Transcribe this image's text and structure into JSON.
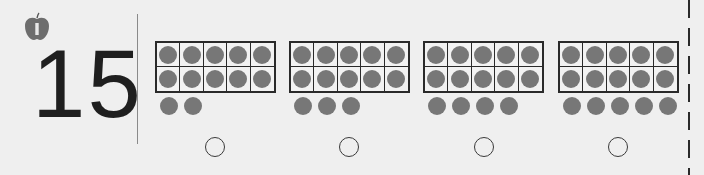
{
  "target_number": "15",
  "icon": "apple-icon",
  "colors": {
    "dot": "#777777",
    "frame_border": "#2a2a2a",
    "background": "#efefef",
    "number": "#1f1f1f"
  },
  "choices": [
    {
      "frame_full_dots": 10,
      "extra_dots": 2,
      "represents": 12
    },
    {
      "frame_full_dots": 10,
      "extra_dots": 3,
      "represents": 13
    },
    {
      "frame_full_dots": 10,
      "extra_dots": 4,
      "represents": 14
    },
    {
      "frame_full_dots": 10,
      "extra_dots": 5,
      "represents": 15
    }
  ]
}
